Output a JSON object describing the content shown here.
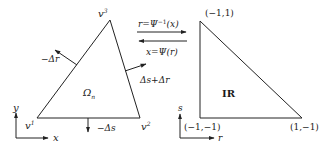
{
  "diagram": {
    "type": "coordinate-mapping",
    "left_element": {
      "region_label": "Ω",
      "region_sub": "n",
      "vertices": [
        {
          "name": "v",
          "sup": "1"
        },
        {
          "name": "v",
          "sup": "2"
        },
        {
          "name": "v",
          "sup": "3"
        }
      ],
      "edge_normals": {
        "left": "−Δr",
        "right": "Δs+Δr",
        "bottom": "−Δs"
      },
      "axes": {
        "x": "x",
        "y": "y"
      }
    },
    "mapping": {
      "forward": {
        "lhs": "r",
        "eq": "=Ψ",
        "sup": "−1",
        "arg": "(x)"
      },
      "inverse": {
        "lhs": "x",
        "eq": "=Ψ",
        "arg": "(r)"
      }
    },
    "right_element": {
      "region_label": "IR",
      "vertices": [
        "(−1,1)",
        "(−1,−1)",
        "(1,−1)"
      ],
      "axes": {
        "x": "r",
        "y": "s"
      }
    }
  },
  "colors": {
    "stroke": "#222222",
    "text": "#1a1a1a",
    "background": "#ffffff"
  }
}
